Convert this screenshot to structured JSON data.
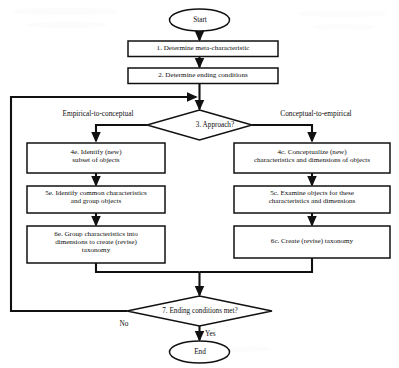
{
  "diagram": {
    "type": "flowchart",
    "nodes": {
      "start": {
        "label": "Start",
        "shape": "terminator"
      },
      "step1": {
        "label": "1. Determine meta-characteristic",
        "shape": "process"
      },
      "step2": {
        "label": "2. Determine ending conditions",
        "shape": "process"
      },
      "approach": {
        "label": "3. Approach?",
        "shape": "decision"
      },
      "step4e": {
        "line1": "4e. Identify (new)",
        "line2": "subset of objects",
        "shape": "process"
      },
      "step5e": {
        "line1": "5e. Identify common characteristics",
        "line2": "and group objects",
        "shape": "process"
      },
      "step6e": {
        "line1": "6e. Group characteristics into",
        "line2": "dimensions to create (revise)",
        "line3": "taxonomy",
        "shape": "process"
      },
      "step4c": {
        "line1": "4c. Conceptualize (new)",
        "line2": "characteristics and dimensions of objects",
        "shape": "process"
      },
      "step5c": {
        "line1": "5c. Examine objects for these",
        "line2": "characteristics and dimensions",
        "shape": "process"
      },
      "step6c": {
        "label": "6c. Create (revise) taxonomy",
        "shape": "process"
      },
      "ending": {
        "label": "7. Ending conditions met?",
        "shape": "decision"
      },
      "end": {
        "label": "End",
        "shape": "terminator"
      }
    },
    "edge_labels": {
      "branch_left": "Empirical-to-conceptual",
      "branch_right": "Conceptual-to-empirical",
      "no": "No",
      "yes": "Yes"
    },
    "colors": {
      "stroke": "#111111",
      "background": "#ffffff",
      "text": "#0d0d0d"
    }
  }
}
